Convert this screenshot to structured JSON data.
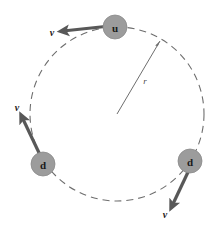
{
  "figure": {
    "background_color": "#ffffff",
    "width": 214,
    "height": 225
  },
  "orbit": {
    "name": "dashed-circle",
    "center_x": 117,
    "center_y": 114,
    "radius": 87,
    "stroke_color": "#6e6e6e",
    "stroke_width": 1.1,
    "dash_pattern": "7 5"
  },
  "radius_line": {
    "name": "radius-indicator",
    "label": "r",
    "from_x": 117,
    "from_y": 114,
    "to_x": 160,
    "to_y": 41,
    "label_x": 145,
    "label_y": 81,
    "stroke_color": "#6e6e6e",
    "stroke_width": 1.0
  },
  "particles": [
    {
      "id": "quark-u",
      "label": "u",
      "cx": 115,
      "cy": 27,
      "r": 12,
      "fill": "#9c9c9c",
      "stroke": "#8a8a8a"
    },
    {
      "id": "quark-d-left",
      "label": "d",
      "cx": 43,
      "cy": 164,
      "r": 12,
      "fill": "#9c9c9c",
      "stroke": "#8a8a8a"
    },
    {
      "id": "quark-d-right",
      "label": "d",
      "cx": 190,
      "cy": 161,
      "r": 12,
      "fill": "#9c9c9c",
      "stroke": "#8a8a8a"
    }
  ],
  "velocity_vectors": [
    {
      "id": "velocity-u",
      "label": "v",
      "from_x": 110,
      "from_y": 26,
      "to_x": 63,
      "to_y": 31,
      "label_x": 52,
      "label_y": 32,
      "stroke_color": "#585858",
      "stroke_width": 3.2
    },
    {
      "id": "velocity-d-left",
      "label": "v",
      "from_x": 41,
      "from_y": 157,
      "to_x": 22,
      "to_y": 117,
      "label_x": 17,
      "label_y": 107,
      "stroke_color": "#585858",
      "stroke_width": 3.2
    },
    {
      "id": "velocity-d-right",
      "label": "v",
      "from_x": 189,
      "from_y": 170,
      "to_x": 172,
      "to_y": 206,
      "label_x": 165,
      "label_y": 214,
      "stroke_color": "#585858",
      "stroke_width": 3.2
    }
  ],
  "colors": {
    "particle_fill": "#9c9c9c",
    "arrow": "#585858",
    "orbit": "#6e6e6e",
    "text": "#1a1a1a"
  }
}
